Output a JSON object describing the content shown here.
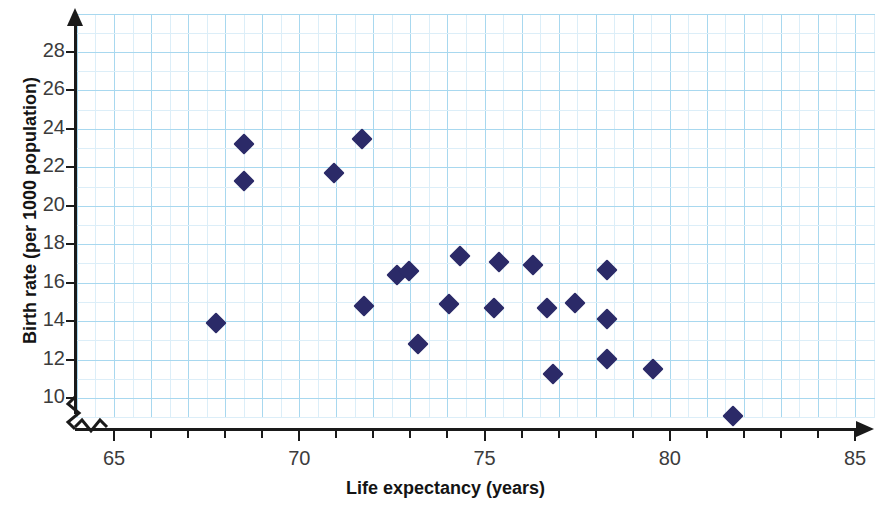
{
  "chart_data": {
    "type": "scatter",
    "title": "",
    "xlabel": "Life expectancy (years)",
    "ylabel": "Birth rate (per 1000 population)",
    "xlim": [
      64,
      86
    ],
    "ylim": [
      9,
      29.5
    ],
    "x_axis_broken": true,
    "y_axis_broken": true,
    "x_tick_labels": [
      "65",
      "70",
      "75",
      "80",
      "85"
    ],
    "x_tick_values": [
      65,
      70,
      75,
      80,
      85
    ],
    "x_minor_tick_step": 1,
    "y_tick_labels": [
      "10",
      "12",
      "14",
      "16",
      "18",
      "20",
      "22",
      "24",
      "26",
      "28"
    ],
    "y_tick_values": [
      10,
      12,
      14,
      16,
      18,
      20,
      22,
      24,
      26,
      28
    ],
    "grid": true,
    "grid_major_color": "#a8d8ef",
    "grid_minor_color": "#dceef8",
    "marker_shape": "diamond",
    "marker_color": "#2b2a68",
    "legend": null,
    "points": [
      {
        "x": 67.75,
        "y": 13.9
      },
      {
        "x": 68.5,
        "y": 23.2
      },
      {
        "x": 68.5,
        "y": 21.3
      },
      {
        "x": 70.95,
        "y": 21.7
      },
      {
        "x": 71.7,
        "y": 23.5
      },
      {
        "x": 71.75,
        "y": 14.8
      },
      {
        "x": 72.65,
        "y": 16.4
      },
      {
        "x": 72.95,
        "y": 16.6
      },
      {
        "x": 73.2,
        "y": 12.8
      },
      {
        "x": 74.05,
        "y": 14.9
      },
      {
        "x": 74.35,
        "y": 17.4
      },
      {
        "x": 75.25,
        "y": 14.7
      },
      {
        "x": 75.4,
        "y": 17.1
      },
      {
        "x": 76.3,
        "y": 16.9
      },
      {
        "x": 76.7,
        "y": 14.7
      },
      {
        "x": 76.85,
        "y": 11.25
      },
      {
        "x": 77.45,
        "y": 14.95
      },
      {
        "x": 78.3,
        "y": 16.65
      },
      {
        "x": 78.3,
        "y": 14.1
      },
      {
        "x": 78.3,
        "y": 12.05
      },
      {
        "x": 79.55,
        "y": 11.5
      },
      {
        "x": 81.7,
        "y": 9.05
      }
    ]
  },
  "axis": {
    "x_title": "Life expectancy (years)",
    "y_title": "Birth rate (per 1000 population)"
  }
}
